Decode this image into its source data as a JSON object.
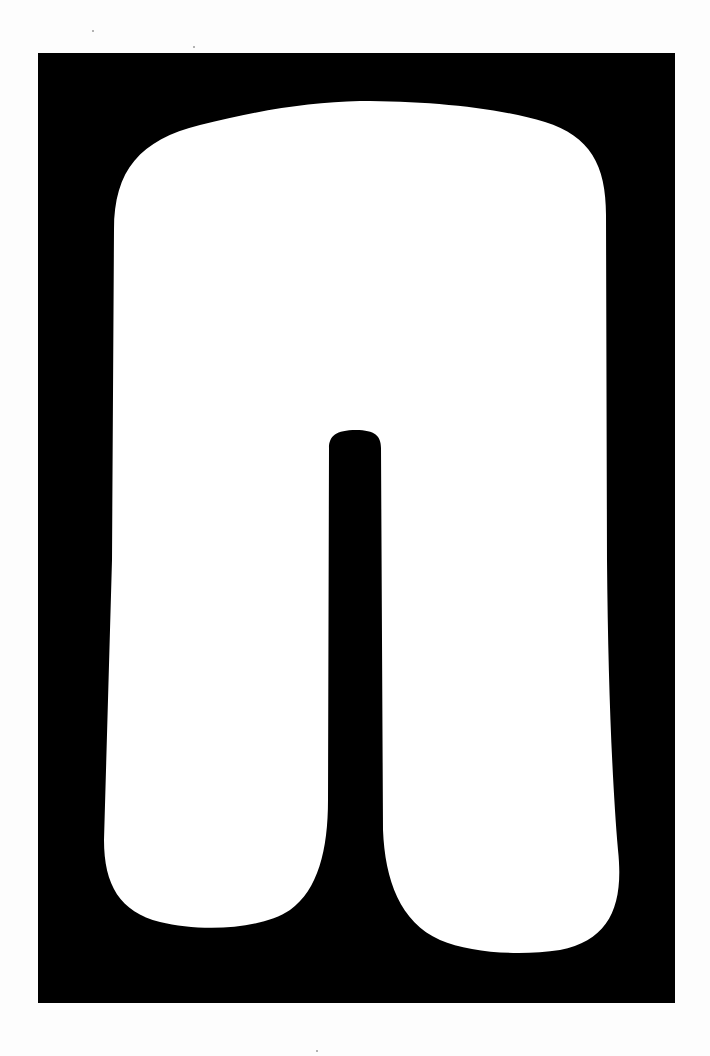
{
  "artwork": {
    "description": "White inverted-U arch shape with central vertical slot on black rectangular field",
    "background_color": "#fdfdfd",
    "panel_color": "#000000",
    "shape_color": "#ffffff",
    "panel": {
      "x": 38,
      "y": 53,
      "width": 637,
      "height": 950
    }
  }
}
